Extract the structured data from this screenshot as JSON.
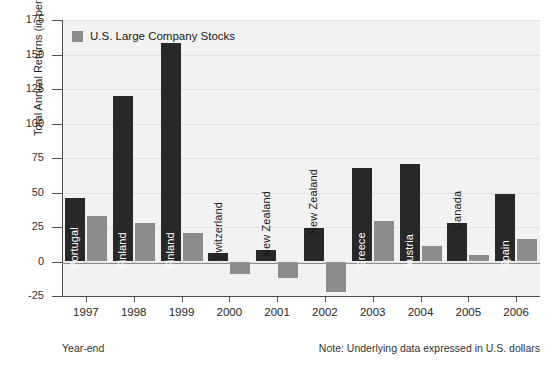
{
  "chart_data": {
    "type": "bar",
    "title": "",
    "subtitle": "",
    "xlabel": "Year-end",
    "ylabel": "Total Annual Returns (in percent)",
    "categories": [
      "1997",
      "1998",
      "1999",
      "2000",
      "2001",
      "2002",
      "2003",
      "2004",
      "2005",
      "2006"
    ],
    "ylim": [
      -25,
      175
    ],
    "yticks": [
      -25,
      0,
      25,
      50,
      75,
      100,
      125,
      150,
      175
    ],
    "ytick_labels": [
      "-25",
      "0",
      "25",
      "50",
      "75",
      "100",
      "125",
      "150",
      "175"
    ],
    "grid": true,
    "legend_position": "top-left",
    "series": [
      {
        "name": "Best Performing Country",
        "color": "#282828",
        "in_legend": false,
        "values": [
          46,
          120,
          158,
          6,
          8,
          24,
          68,
          71,
          28,
          49
        ],
        "point_labels": [
          "Portugal",
          "Finland",
          "Finland",
          "Switzerland",
          "New Zealand",
          "New Zealand",
          "Greece",
          "Austria",
          "Canada",
          "Spain"
        ]
      },
      {
        "name": "U.S. Large Company Stocks",
        "color": "#8c8c8c",
        "in_legend": true,
        "values": [
          33,
          28,
          21,
          -9,
          -12,
          -22,
          29,
          11,
          5,
          16
        ]
      }
    ],
    "annotations": [
      "Year-end",
      "Note: Underlying data expressed in U.S. dollars"
    ]
  },
  "legend": {
    "label": "U.S. Large Company Stocks",
    "swatch_color": "#8c8c8c"
  },
  "footnotes": {
    "left": "Year-end",
    "right": "Note: Underlying data expressed in U.S. dollars"
  },
  "axes": {
    "y_title": "Total Annual Returns (in percent)"
  },
  "colors": {
    "dark_bar": "#282828",
    "gray_bar": "#8c8c8c",
    "plot_bg": "#f2f2f2",
    "axis": "#4d4d4d",
    "gridline": "#e2e2e2"
  }
}
